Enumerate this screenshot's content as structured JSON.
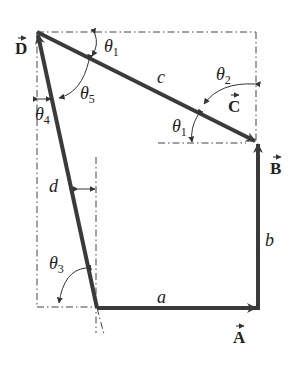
{
  "diagram": {
    "type": "vector-loop",
    "points": {
      "D": {
        "x": 37,
        "y": 32
      },
      "C_head": {
        "x": 257,
        "y": 142
      },
      "B_tail": {
        "x": 258,
        "y": 308
      },
      "A_tail": {
        "x": 97,
        "y": 308
      },
      "A_head": {
        "x": 258,
        "y": 308
      }
    },
    "vectors": [
      {
        "name": "A",
        "label": "A",
        "magnitude": "a"
      },
      {
        "name": "B",
        "label": "B",
        "magnitude": "b"
      },
      {
        "name": "C",
        "label": "C",
        "magnitude": "c"
      },
      {
        "name": "D",
        "label": "D",
        "magnitude": "d"
      }
    ],
    "angles": [
      {
        "name": "theta1_top",
        "symbol": "θ",
        "sub": "1"
      },
      {
        "name": "theta1_bottom",
        "symbol": "θ",
        "sub": "1"
      },
      {
        "name": "theta2",
        "symbol": "θ",
        "sub": "2"
      },
      {
        "name": "theta3",
        "symbol": "θ",
        "sub": "3"
      },
      {
        "name": "theta4",
        "symbol": "θ",
        "sub": "4"
      },
      {
        "name": "theta5",
        "symbol": "θ",
        "sub": "5"
      }
    ],
    "colors": {
      "vector": "#3a3a3a",
      "guide": "#444444",
      "text": "#222222"
    }
  },
  "labels": {
    "A": "A",
    "B": "B",
    "C": "C",
    "D": "D",
    "a": "a",
    "b": "b",
    "c": "c",
    "d": "d",
    "theta": "θ",
    "s1": "1",
    "s2": "2",
    "s3": "3",
    "s4": "4",
    "s5": "5"
  }
}
